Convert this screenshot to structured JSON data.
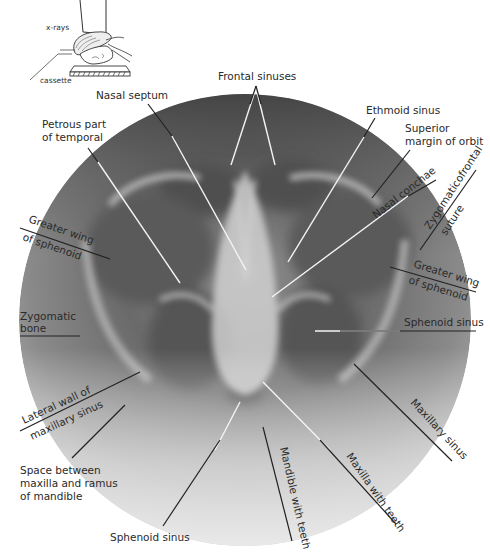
{
  "figure": {
    "type": "radiograph-diagram",
    "view": "occipitomental sinus projection",
    "inset": {
      "labels": {
        "xrays": "x-rays",
        "cassette": "cassette"
      }
    },
    "labels": {
      "frontal_sinuses": "Frontal sinuses",
      "nasal_septum": "Nasal septum",
      "petrous_part_l1": "Petrous part",
      "petrous_part_l2": "of temporal",
      "ethmoid_sinus": "Ethmoid sinus",
      "superior_margin_l1": "Superior",
      "superior_margin_l2": "margin of orbit",
      "nasal_conchae": "Nasal conchae",
      "zygomaticofrontal_l1": "Zygomaticofrontal",
      "zygomaticofrontal_l2": "suture",
      "greater_wing_left_l1": "Greater wing",
      "greater_wing_left_l2": "of sphenoid",
      "greater_wing_right_l1": "Greater wing",
      "greater_wing_right_l2": "of sphenoid",
      "zygomatic_bone_l1": "Zygomatic",
      "zygomatic_bone_l2": "bone",
      "sphenoid_sinus_right": "Sphenoid sinus",
      "lateral_wall_l1": "Lateral wall of",
      "lateral_wall_l2": "maxillary sinus",
      "space_between_l1": "Space between",
      "space_between_l2": "maxilla and ramus",
      "space_between_l3": "of mandible",
      "maxillary_sinus": "Maxillary sinus",
      "maxilla_with_teeth": "Maxilla with teeth",
      "mandible_with_teeth": "Mandible with teeth",
      "sphenoid_sinus_bottom": "Sphenoid sinus"
    },
    "colors": {
      "background": "#ffffff",
      "radiograph_dark": "#4a4a4a",
      "radiograph_mid": "#7a7a7a",
      "radiograph_light": "#d8d8d8",
      "label_text": "#2a2a2a",
      "leader_dark": "#222222",
      "leader_light": "#f4f4f4"
    }
  }
}
